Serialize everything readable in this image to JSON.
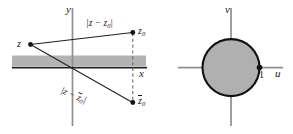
{
  "figure": {
    "colors": {
      "ink": "#1a1a1a",
      "axis": "#8c8c8c",
      "band_fill": "#b3b3b3",
      "disk_fill": "#b0b0b0",
      "background": "#ffffff"
    }
  },
  "left_panel": {
    "name": "z-plane",
    "axes": {
      "vertical_label": "y",
      "horizontal_label": "x"
    },
    "points": [
      {
        "id": "z",
        "label": "z",
        "label_sub": ""
      },
      {
        "id": "z0",
        "label": "z",
        "label_sub": "0"
      },
      {
        "id": "z0bar",
        "label": "z",
        "label_sub": "0",
        "overbar": true
      }
    ],
    "distances": [
      {
        "id": "dist-upper",
        "open": "|",
        "expr": "z − z",
        "sub": "0",
        "close": "|",
        "overbar": false
      },
      {
        "id": "dist-lower",
        "open": "|",
        "expr": "z − z",
        "sub": "0",
        "close": "|",
        "overbar": true
      }
    ],
    "band": {
      "name": "shaded-strip",
      "description": "gray horizontal band above x-axis"
    },
    "connector": {
      "name": "dashed-connector",
      "style": "dashed vertical segment from z0 to z0-bar"
    }
  },
  "right_panel": {
    "name": "w-plane",
    "axes": {
      "vertical_label": "v",
      "horizontal_label": "u"
    },
    "disk": {
      "name": "shaded-unit-disk",
      "description": "gray filled circle centered at origin"
    },
    "marked_point": {
      "label": "1",
      "position": "on u-axis at circle right edge"
    }
  }
}
